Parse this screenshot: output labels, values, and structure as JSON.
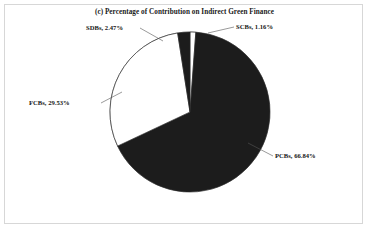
{
  "figure": {
    "title": "(c) Percentage of Contribution on Indirect Green Finance",
    "frame_color": "#d7d7d7",
    "background": "#ffffff"
  },
  "labels": {
    "scbs": "SCBs, 1.16%",
    "sdbs": "SDBs, 2.47%",
    "fcbs": "FCBs, 29.53%",
    "pcbs": "PCBs, 66.84%"
  },
  "chart_data": {
    "type": "pie",
    "title": "(c) Percentage of Contribution on Indirect Green Finance",
    "subtitle": "",
    "xlabel": "",
    "ylabel": "",
    "legend_position": "none",
    "grid": false,
    "label_format": "{name}, {value}%",
    "start_angle_deg": 0,
    "direction": "clockwise",
    "total": 100.0,
    "categories": [
      "SCBs",
      "PCBs",
      "FCBs",
      "SDBs"
    ],
    "values": [
      1.16,
      66.84,
      29.53,
      2.47
    ],
    "colors": [
      "#ffffff",
      "#1c1c1c",
      "#ffffff",
      "#1c1c1c"
    ],
    "slice_edge_color": "#2b2b2b",
    "annotations": [
      "SCBs, 1.16%",
      "PCBs, 66.84%",
      "FCBs, 29.53%",
      "SDBs, 2.47%"
    ],
    "slices": [
      {
        "name": "SCBs",
        "value": 1.16,
        "color": "#ffffff",
        "label": "SCBs, 1.16%"
      },
      {
        "name": "PCBs",
        "value": 66.84,
        "color": "#1c1c1c",
        "label": "PCBs, 66.84%"
      },
      {
        "name": "FCBs",
        "value": 29.53,
        "color": "#ffffff",
        "label": "FCBs, 29.53%"
      },
      {
        "name": "SDBs",
        "value": 2.47,
        "color": "#1c1c1c",
        "label": "SDBs, 2.47%"
      }
    ]
  }
}
